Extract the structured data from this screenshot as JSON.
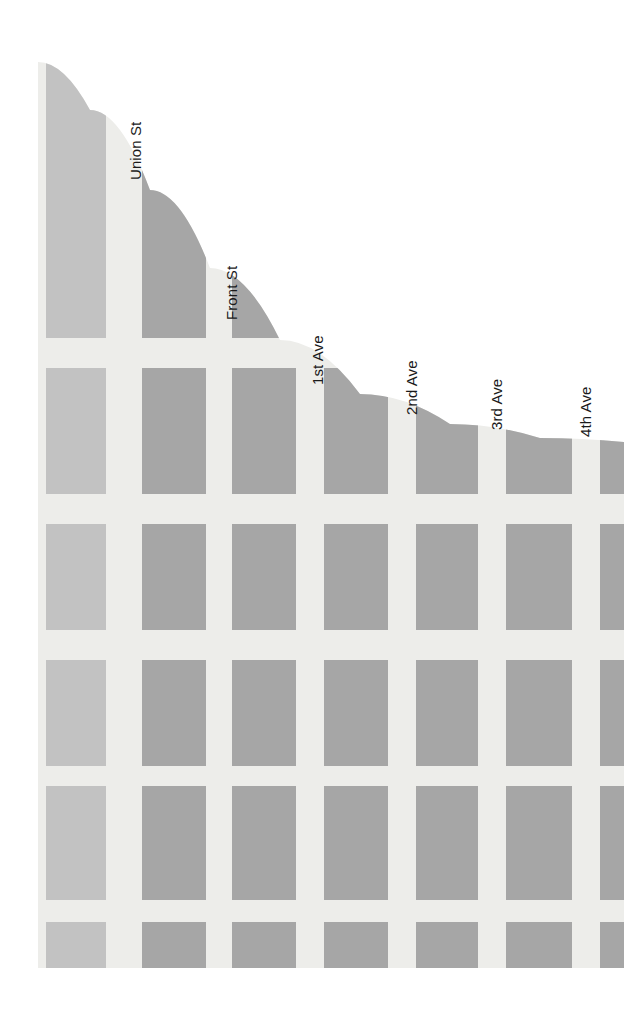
{
  "map": {
    "title": "City Grid Map",
    "canvas": {
      "width": 624,
      "height": 1023
    },
    "orientation": "rotated-90",
    "colors": {
      "background": "#ffffff",
      "water": "#ffffff",
      "street_surface": "#ededea",
      "block_light": "#c2c2c2",
      "block_dark": "#a6a6a6",
      "label_text": "#1a1a1a"
    },
    "land_extent": {
      "left": 38,
      "top": 62,
      "right": 624,
      "bottom": 968
    },
    "labels": [
      {
        "id": "union-st",
        "text": "Union St",
        "x": 128,
        "y": 180,
        "rotation": -90
      },
      {
        "id": "front-st",
        "text": "Front St",
        "x": 224,
        "y": 320,
        "rotation": -90
      },
      {
        "id": "1st-ave",
        "text": "1st Ave",
        "x": 310,
        "y": 385,
        "rotation": -90
      },
      {
        "id": "2nd-ave",
        "text": "2nd Ave",
        "x": 404,
        "y": 415,
        "rotation": -90
      },
      {
        "id": "3rd-ave",
        "text": "3rd Ave",
        "x": 489,
        "y": 430,
        "rotation": -90
      },
      {
        "id": "4th-ave",
        "text": "4th Ave",
        "x": 578,
        "y": 437,
        "rotation": -90
      }
    ],
    "street_columns": [
      {
        "id": "union-st",
        "name": "Union St",
        "block_left": 46,
        "block_right": 106,
        "tone": "light"
      },
      {
        "id": "front-st",
        "name": "Front St",
        "block_left": 142,
        "block_right": 206,
        "tone": "dark"
      },
      {
        "id": "1st-ave",
        "name": "1st Ave",
        "block_left": 232,
        "block_right": 296,
        "tone": "dark"
      },
      {
        "id": "2nd-ave",
        "name": "2nd Ave",
        "block_left": 324,
        "block_right": 388,
        "tone": "dark"
      },
      {
        "id": "3rd-ave",
        "name": "3rd Ave",
        "block_left": 416,
        "block_right": 478,
        "tone": "dark"
      },
      {
        "id": "4th-ave",
        "name": "4th Ave",
        "block_left": 506,
        "block_right": 572,
        "tone": "dark"
      },
      {
        "id": "5th-ave",
        "name": "5th Ave",
        "block_left": 600,
        "block_right": 624,
        "tone": "dark"
      }
    ],
    "block_rows": [
      {
        "index": 0,
        "top": 62,
        "bottom": 338
      },
      {
        "index": 1,
        "top": 368,
        "bottom": 494
      },
      {
        "index": 2,
        "top": 524,
        "bottom": 630
      },
      {
        "index": 3,
        "top": 660,
        "bottom": 766
      },
      {
        "index": 4,
        "top": 786,
        "bottom": 900
      },
      {
        "index": 5,
        "top": 922,
        "bottom": 968
      }
    ],
    "shoreline": {
      "description": "curved water boundary sweeping from upper-left down to the right edge",
      "points": [
        {
          "x": 38,
          "y": 62
        },
        {
          "x": 90,
          "y": 110
        },
        {
          "x": 150,
          "y": 190
        },
        {
          "x": 210,
          "y": 268
        },
        {
          "x": 280,
          "y": 340
        },
        {
          "x": 360,
          "y": 394
        },
        {
          "x": 450,
          "y": 424
        },
        {
          "x": 540,
          "y": 438
        },
        {
          "x": 624,
          "y": 442
        }
      ]
    }
  }
}
